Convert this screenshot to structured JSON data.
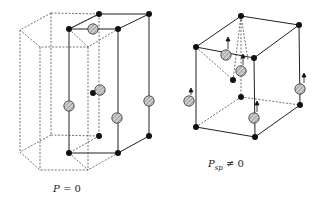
{
  "figures": [
    {
      "id": "hexagonal",
      "caption_symbol": "P",
      "caption_sub": "",
      "caption_rel": "= 0",
      "description": "Cubic-like cell inside hexagonal prism; no spontaneous polarization"
    },
    {
      "id": "distorted",
      "caption_symbol": "P",
      "caption_sub": "sp",
      "caption_rel": "≠ 0",
      "description": "Distorted cell with displaced atoms; spontaneous polarization nonzero"
    }
  ],
  "colors": {
    "line": "#222222",
    "dashed": "#333333",
    "atom_dark": "#111111",
    "atom_hatched_fill": "#bdbdbd"
  }
}
